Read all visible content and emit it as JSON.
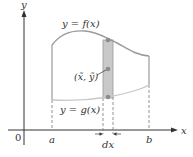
{
  "figure": {
    "axes": {
      "x_label": "x",
      "y_label": "y",
      "origin_label": "0"
    },
    "curves": {
      "upper_label": "y = f(x)",
      "lower_label": "y = g(x)"
    },
    "ticks": {
      "a_label": "a",
      "b_label": "b"
    },
    "strip": {
      "width_label": "dx",
      "centroid_label": "(x̃, ỹ)"
    },
    "colors": {
      "upper_curve": "#9a9a9a",
      "lower_curve": "#c8c8c8",
      "strip_fill": "#c9c9c9",
      "points": "#8c8c8c",
      "axes": "#333333"
    }
  }
}
